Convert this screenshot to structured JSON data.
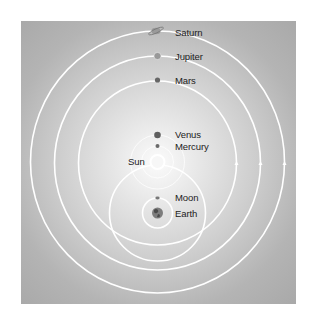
{
  "diagram": {
    "type": "geoheliocentric-model",
    "colors": {
      "orbit": "#ffffff",
      "background_center": "#fbfbfb",
      "background_edge": "#a6a6a6",
      "planet": "#555555",
      "label": "#222222"
    },
    "labels": {
      "saturn": "Saturn",
      "jupiter": "Jupiter",
      "mars": "Mars",
      "venus": "Venus",
      "mercury": "Mercury",
      "sun": "Sun",
      "moon": "Moon",
      "earth": "Earth"
    },
    "bodies": [
      {
        "name": "Saturn",
        "icon": "saturn-icon",
        "orbit_center": "Sun"
      },
      {
        "name": "Jupiter",
        "icon": "jupiter-icon",
        "orbit_center": "Sun"
      },
      {
        "name": "Mars",
        "icon": "mars-icon",
        "orbit_center": "Sun"
      },
      {
        "name": "Venus",
        "icon": "venus-icon",
        "orbit_center": "Sun"
      },
      {
        "name": "Mercury",
        "icon": "mercury-icon",
        "orbit_center": "Sun"
      },
      {
        "name": "Sun",
        "icon": "sun-icon",
        "orbit_center": "Earth"
      },
      {
        "name": "Moon",
        "icon": "moon-icon",
        "orbit_center": "Earth"
      },
      {
        "name": "Earth",
        "icon": "earth-icon",
        "orbit_center": null
      }
    ]
  }
}
